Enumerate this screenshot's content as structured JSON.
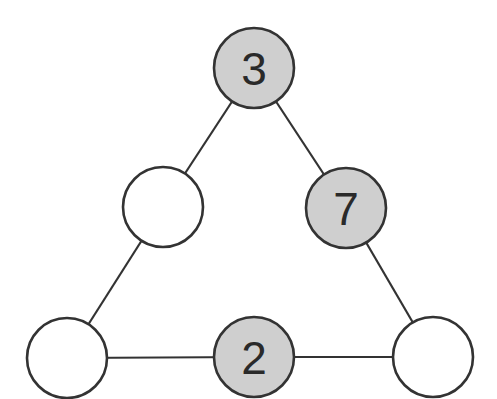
{
  "colors": {
    "filled": "#cfcfcf",
    "empty": "#ffffff",
    "stroke": "#333333"
  },
  "nodes": [
    {
      "id": "top",
      "cx": 254,
      "cy": 68,
      "r": 40,
      "filled": true,
      "label": "3"
    },
    {
      "id": "mid-left",
      "cx": 163,
      "cy": 207,
      "r": 40,
      "filled": false,
      "label": ""
    },
    {
      "id": "mid-right",
      "cx": 346,
      "cy": 208,
      "r": 40,
      "filled": true,
      "label": "7"
    },
    {
      "id": "bottom-left",
      "cx": 67,
      "cy": 358,
      "r": 40,
      "filled": false,
      "label": ""
    },
    {
      "id": "bottom-middle",
      "cx": 254,
      "cy": 357,
      "r": 40,
      "filled": true,
      "label": "2"
    },
    {
      "id": "bottom-right",
      "cx": 433,
      "cy": 357,
      "r": 40,
      "filled": false,
      "label": ""
    }
  ],
  "edges": [
    [
      "top",
      "mid-left"
    ],
    [
      "mid-left",
      "bottom-left"
    ],
    [
      "top",
      "mid-right"
    ],
    [
      "mid-right",
      "bottom-right"
    ],
    [
      "bottom-left",
      "bottom-middle"
    ],
    [
      "bottom-middle",
      "bottom-right"
    ]
  ]
}
